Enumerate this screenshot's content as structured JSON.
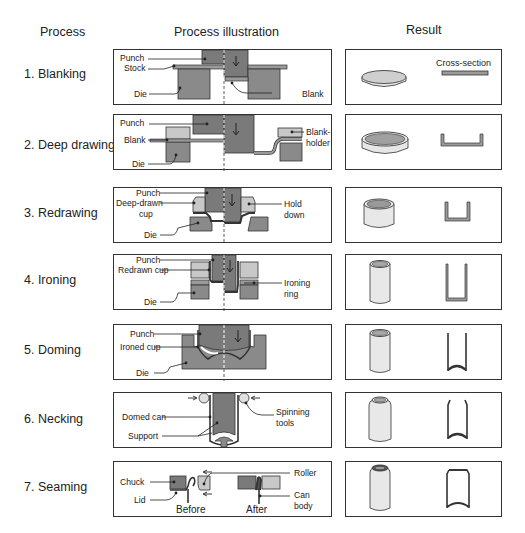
{
  "headers": {
    "process": "Process",
    "illustration": "Process illustration",
    "result": "Result"
  },
  "rows": [
    {
      "label": "1. Blanking",
      "callouts": [
        "Punch",
        "Stock",
        "Die",
        "Blank"
      ],
      "result": {
        "shape": "disc",
        "cross_section_label": "Cross-section"
      }
    },
    {
      "label": "2. Deep drawing",
      "callouts": [
        "Punch",
        "Blank",
        "Die",
        "Blank-",
        "holder"
      ],
      "result": {
        "shape": "shallow-cup"
      }
    },
    {
      "label": "3. Redrawing",
      "callouts": [
        "Punch",
        "Deep-drawn",
        "cup",
        "Die",
        "Hold",
        "down"
      ],
      "result": {
        "shape": "cup"
      }
    },
    {
      "label": "4. Ironing",
      "callouts": [
        "Punch",
        "Redrawn cup",
        "Die",
        "Ironing",
        "ring"
      ],
      "result": {
        "shape": "tall-cylinder"
      }
    },
    {
      "label": "5. Doming",
      "callouts": [
        "Punch",
        "Ironed cup",
        "Die"
      ],
      "result": {
        "shape": "domed-can"
      }
    },
    {
      "label": "6. Necking",
      "callouts": [
        "Domed can",
        "Support",
        "Spinning",
        "tools"
      ],
      "result": {
        "shape": "necked-can"
      }
    },
    {
      "label": "7. Seaming",
      "callouts": [
        "Chuck",
        "Lid",
        "Roller",
        "Can",
        "body",
        "Before",
        "After"
      ],
      "result": {
        "shape": "seamed-can"
      }
    }
  ],
  "colors": {
    "tool_dark": "#7a7a7a",
    "tool_light": "#c8c8c8",
    "outline": "#333333",
    "stock": "#9a9a9a"
  }
}
